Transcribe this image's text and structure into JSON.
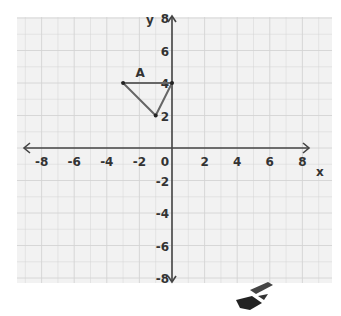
{
  "chart_data": {
    "type": "scatter",
    "title": "",
    "xlabel": "x",
    "ylabel": "y",
    "xlim": [
      -9,
      9
    ],
    "ylim": [
      -8,
      8
    ],
    "grid": true,
    "x_ticks": [
      "-8",
      "-6",
      "-4",
      "-2",
      "0",
      "2",
      "4",
      "6",
      "8"
    ],
    "y_ticks": [
      "8",
      "6",
      "4",
      "2",
      "-2",
      "-4",
      "-6",
      "-8"
    ],
    "shapes": [
      {
        "name": "A",
        "type": "triangle",
        "vertices": [
          [
            -3,
            4
          ],
          [
            0,
            4
          ],
          [
            -1,
            2
          ]
        ],
        "label_pos": [
          -2,
          4.5
        ]
      }
    ]
  },
  "colors": {
    "grid": "#d4d4d4",
    "axis": "#444444",
    "shape": "#666666",
    "panel": "#f2f2f2"
  }
}
